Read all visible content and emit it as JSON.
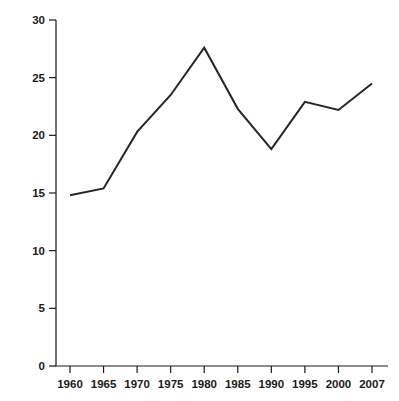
{
  "chart_data": {
    "type": "line",
    "title": "",
    "subtitle": "",
    "xlabel": "",
    "ylabel": "Percent State-Local Revenues from Federal Grants",
    "categories": [
      "1960",
      "1965",
      "1970",
      "1975",
      "1980",
      "1985",
      "1990",
      "1995",
      "2000",
      "2007"
    ],
    "x": [
      1960,
      1965,
      1970,
      1975,
      1980,
      1985,
      1990,
      1995,
      2000,
      2007
    ],
    "values": [
      14.8,
      15.4,
      20.3,
      23.5,
      27.6,
      22.3,
      18.8,
      22.9,
      22.2,
      24.5
    ],
    "series": [
      {
        "name": "Percent State-Local Revenues from Federal Grants",
        "values": [
          14.8,
          15.4,
          20.3,
          23.5,
          27.6,
          22.3,
          18.8,
          22.9,
          22.2,
          24.5
        ]
      }
    ],
    "ylim": [
      0,
      30
    ],
    "yticks": [
      0,
      5,
      10,
      15,
      20,
      25,
      30
    ],
    "ytick_labels": [
      "0",
      "5",
      "10",
      "15",
      "20",
      "25",
      "30"
    ],
    "xtick_labels": [
      "1960",
      "1965",
      "1970",
      "1975",
      "1980",
      "1985",
      "1990",
      "1995",
      "2000",
      "2007"
    ],
    "grid": false,
    "legend": false,
    "legend_position": "none",
    "line_color": "#262626",
    "background_color": "#ffffff",
    "axis_color": "#1a1a1a"
  }
}
